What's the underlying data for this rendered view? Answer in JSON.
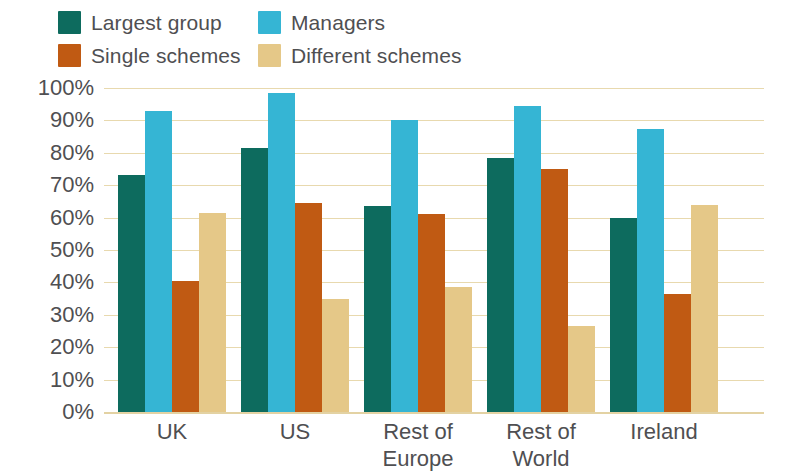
{
  "chart_data": {
    "type": "bar",
    "title": "",
    "xlabel": "",
    "ylabel": "",
    "ylim": [
      0,
      100
    ],
    "grid": true,
    "legend_position": "top-left",
    "categories": [
      "UK",
      "US",
      "Rest of\nEurope",
      "Rest of\nWorld",
      "Ireland"
    ],
    "y_tick_labels": [
      "100%",
      "90%",
      "80%",
      "70%",
      "60%",
      "50%",
      "40%",
      "30%",
      "20%",
      "10%",
      "0%"
    ],
    "y_tick_values": [
      100,
      90,
      80,
      70,
      60,
      50,
      40,
      30,
      20,
      10,
      0
    ],
    "series": [
      {
        "name": "Largest group",
        "color": "#0d6b5e",
        "values": [
          73,
          81.5,
          63.5,
          78.5,
          60
        ]
      },
      {
        "name": "Managers",
        "color": "#35b5d4",
        "values": [
          93,
          98.5,
          90,
          94.5,
          87.5
        ]
      },
      {
        "name": "Single schemes",
        "color": "#c05a13",
        "values": [
          40.5,
          64.5,
          61,
          75,
          36.5
        ]
      },
      {
        "name": "Different schemes",
        "color": "#e5c888",
        "values": [
          61.5,
          35,
          38.5,
          26.5,
          64
        ]
      }
    ]
  },
  "style": {
    "gridline_color": "#e8d9ae",
    "text_color": "#4f4f52",
    "background": "#ffffff"
  }
}
